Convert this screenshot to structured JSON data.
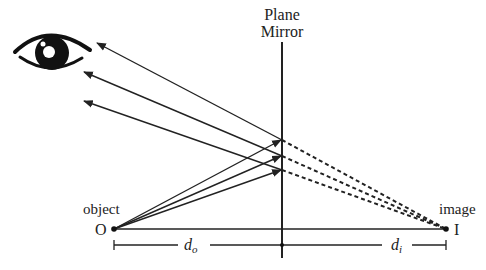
{
  "title": {
    "line1": "Plane",
    "line2": "Mirror"
  },
  "labels": {
    "object": "object",
    "object_point": "O",
    "image": "image",
    "image_point": "I",
    "d_object": "d",
    "d_object_sub": "o",
    "d_image": "d",
    "d_image_sub": "i"
  },
  "icons": {
    "eye": "eye-icon"
  },
  "colors": {
    "ink": "#222222",
    "background": "#ffffff"
  }
}
